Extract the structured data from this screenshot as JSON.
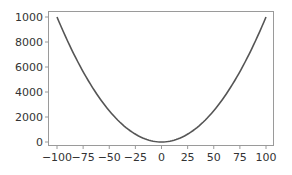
{
  "chart_data": {
    "type": "line",
    "title": "",
    "xlabel": "",
    "ylabel": "",
    "function": "y = x^2",
    "x": [
      -100,
      -75,
      -50,
      -25,
      0,
      25,
      50,
      75,
      100
    ],
    "series": [
      {
        "name": "y = x^2",
        "values": [
          10000,
          5625,
          2500,
          625,
          0,
          625,
          2500,
          5625,
          10000
        ],
        "color": "#555555"
      }
    ],
    "xlim": [
      -105,
      105
    ],
    "ylim": [
      -500,
      10500
    ],
    "xticks": [
      -100,
      -75,
      -50,
      -25,
      0,
      25,
      50,
      75,
      100
    ],
    "xtick_labels": [
      "−100",
      "−75",
      "−50",
      "−25",
      "0",
      "25",
      "50",
      "75",
      "100"
    ],
    "yticks": [
      0,
      2000,
      4000,
      6000,
      8000,
      10000
    ],
    "ytick_labels": [
      "0",
      "2000",
      "4000",
      "6000",
      "8000",
      "1000"
    ],
    "grid": false,
    "legend": null
  }
}
